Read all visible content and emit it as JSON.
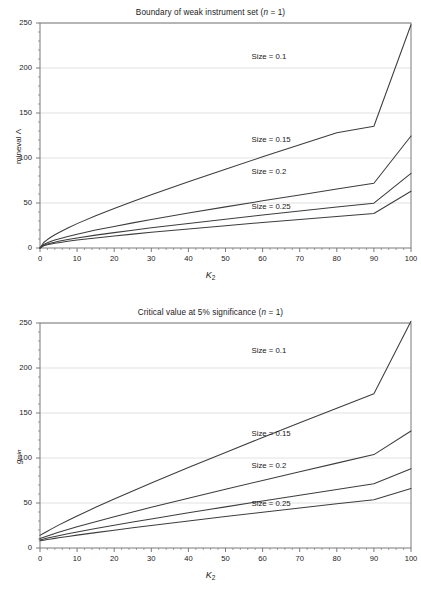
{
  "figure": {
    "width": 421,
    "height": 599,
    "background": "#ffffff",
    "curve_color": "#3d3d3d",
    "grid_color": "#d9d9d9",
    "axis_color": "#7a7a7a"
  },
  "chart_data": [
    {
      "type": "line",
      "panel": "top",
      "title": "Boundary of weak instrument set (n = 1)",
      "title_prefix": "Boundary of weak instrument set (",
      "title_italic": "n",
      "title_suffix": " = 1)",
      "xlabel": "K2",
      "xlabel_base": "K",
      "xlabel_sub": "2",
      "ylabel": "mineval Λ",
      "ylabel_text": "mineval ",
      "ylabel_symbol": "Λ",
      "xlim": [
        0,
        100
      ],
      "ylim": [
        0,
        250
      ],
      "xticks": [
        0,
        10,
        20,
        30,
        40,
        50,
        60,
        70,
        80,
        90,
        100
      ],
      "yticks": [
        0,
        50,
        100,
        150,
        200,
        250
      ],
      "minor_x_step": 2,
      "minor_y_step": 10,
      "grid": "horizontal",
      "legend": "inline-annotations",
      "x": [
        0,
        1,
        2,
        3,
        4,
        5,
        7.5,
        10,
        15,
        20,
        25,
        30,
        40,
        50,
        60,
        70,
        80,
        90,
        100
      ],
      "series": [
        {
          "name": "Size = 0.1",
          "label": "Size = 0.1",
          "values": [
            0,
            6.1,
            9.4,
            12.2,
            14.7,
            17.0,
            22.3,
            27.1,
            35.8,
            43.9,
            51.6,
            59.1,
            73.6,
            87.6,
            101.3,
            114.8,
            128.1,
            135.3,
            248.0
          ],
          "value_at_100": 248
        },
        {
          "name": "Size = 0.15",
          "label": "Size = 0.15",
          "values": [
            0,
            3.9,
            5.8,
            7.4,
            8.8,
            10.1,
            12.9,
            15.4,
            19.9,
            24.0,
            27.9,
            31.6,
            38.8,
            45.7,
            52.4,
            59.0,
            65.5,
            71.9,
            124.5
          ],
          "value_at_100": 124.5
        },
        {
          "name": "Size = 0.2",
          "label": "Size = 0.2",
          "values": [
            0,
            3.0,
            4.4,
            5.5,
            6.5,
            7.4,
            9.4,
            11.2,
            14.3,
            17.1,
            19.8,
            22.4,
            27.3,
            32.0,
            36.6,
            41.1,
            45.5,
            49.8,
            83.0
          ],
          "value_at_100": 83
        },
        {
          "name": "Size = 0.25",
          "label": "Size = 0.25",
          "values": [
            0,
            2.4,
            3.5,
            4.4,
            5.2,
            5.9,
            7.4,
            8.8,
            11.2,
            13.4,
            15.4,
            17.4,
            21.2,
            24.8,
            28.3,
            31.7,
            35.0,
            38.3,
            63.0
          ],
          "value_at_100": 63
        }
      ],
      "annotations": [
        {
          "text": "Size = 0.1",
          "x": 57,
          "y": 212
        },
        {
          "text": "Size = 0.15",
          "x": 57,
          "y": 120
        },
        {
          "text": "Size = 0.2",
          "x": 57,
          "y": 84
        },
        {
          "text": "Size = 0.25",
          "x": 57,
          "y": 46
        }
      ]
    },
    {
      "type": "line",
      "panel": "bottom",
      "title": "Critical value at 5% significance (n = 1)",
      "title_prefix": "Critical value at 5% significance (",
      "title_italic": "n",
      "title_suffix": " = 1)",
      "xlabel": "K2",
      "xlabel_base": "K",
      "xlabel_sub": "2",
      "ylabel": "gmin",
      "ylabel_base": "g",
      "ylabel_sub": "min",
      "xlim": [
        0,
        100
      ],
      "ylim": [
        0,
        250
      ],
      "xticks": [
        0,
        10,
        20,
        30,
        40,
        50,
        60,
        70,
        80,
        90,
        100
      ],
      "yticks": [
        0,
        50,
        100,
        150,
        200,
        250
      ],
      "minor_x_step": 2,
      "minor_y_step": 10,
      "grid": "horizontal",
      "legend": "inline-annotations",
      "x": [
        0,
        1,
        2,
        3,
        4,
        5,
        7.5,
        10,
        15,
        20,
        25,
        30,
        40,
        50,
        60,
        70,
        80,
        90,
        100
      ],
      "series": [
        {
          "name": "Size = 0.1",
          "label": "Size = 0.1",
          "values": [
            14.0,
            16.4,
            18.7,
            21.0,
            23.2,
            25.4,
            30.6,
            35.6,
            45.2,
            54.4,
            63.4,
            72.2,
            89.4,
            106.2,
            122.8,
            139.2,
            155.4,
            171.5,
            252.0
          ],
          "value_at_100": 252
        },
        {
          "name": "Size = 0.15",
          "label": "Size = 0.15",
          "values": [
            10.5,
            12.0,
            13.4,
            14.8,
            16.1,
            17.4,
            20.5,
            23.5,
            29.2,
            34.7,
            40.0,
            45.2,
            55.4,
            65.3,
            75.1,
            84.7,
            94.3,
            103.8,
            130.0
          ],
          "value_at_100": 130
        },
        {
          "name": "Size = 0.2",
          "label": "Size = 0.2",
          "values": [
            9.0,
            10.0,
            11.0,
            11.9,
            12.8,
            13.7,
            15.8,
            17.8,
            21.6,
            25.3,
            28.8,
            32.3,
            39.1,
            45.7,
            52.2,
            58.6,
            65.0,
            71.3,
            88.0
          ],
          "value_at_100": 88
        },
        {
          "name": "Size = 0.25",
          "label": "Size = 0.25",
          "values": [
            8.0,
            8.7,
            9.4,
            10.1,
            10.7,
            11.3,
            12.8,
            14.3,
            17.1,
            19.8,
            22.4,
            25.0,
            30.0,
            34.9,
            39.7,
            44.4,
            49.1,
            53.7,
            66.0
          ],
          "value_at_100": 66
        }
      ],
      "annotations": [
        {
          "text": "Size = 0.1",
          "x": 57,
          "y": 219
        },
        {
          "text": "Size = 0.15",
          "x": 57,
          "y": 127
        },
        {
          "text": "Size = 0.2",
          "x": 57,
          "y": 91
        },
        {
          "text": "Size = 0.25",
          "x": 57,
          "y": 49
        }
      ]
    }
  ]
}
